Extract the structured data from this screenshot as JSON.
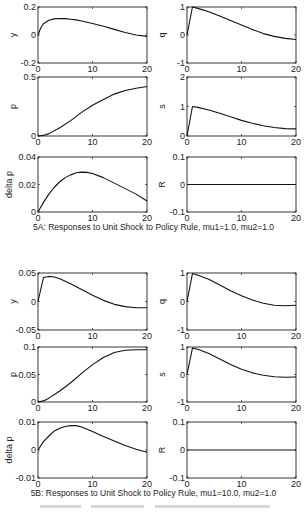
{
  "figure": {
    "captions": [
      {
        "id": "5A",
        "text": "5A: Responses to Unit Shock to Policy Rule, mu1=1.0, mu2=1.0",
        "top": 222
      },
      {
        "id": "5B",
        "text": "5B: Responses to Unit Shock to Policy Rule, mu1=10.0, mu2=1.0",
        "top": 488
      }
    ],
    "footer_text_illegible": true
  },
  "chart_data": [
    {
      "panel": "5A",
      "type": "line",
      "title": "",
      "ylabel": "y",
      "xlabel": "",
      "xlim": [
        0,
        20
      ],
      "ylim": [
        -0.2,
        0.2
      ],
      "xticks": [
        "0",
        "10",
        "20"
      ],
      "yticks": [
        "-0.2",
        "0",
        "0.2"
      ],
      "ytick_values": [
        -0.2,
        0,
        0.2
      ],
      "grid": false,
      "box": {
        "x": 38,
        "y": 7,
        "w": 109,
        "h": 56
      },
      "x": [
        0,
        0.5,
        1,
        2,
        3,
        4,
        5,
        6,
        7,
        8,
        10,
        12,
        14,
        16,
        18,
        20
      ],
      "values": [
        0,
        0.05,
        0.08,
        0.105,
        0.115,
        0.118,
        0.117,
        0.113,
        0.108,
        0.1,
        0.082,
        0.062,
        0.04,
        0.018,
        0.0,
        -0.01
      ]
    },
    {
      "panel": "5A",
      "type": "line",
      "ylabel": "q",
      "xlabel": "",
      "xlim": [
        0,
        20
      ],
      "ylim": [
        -1,
        1
      ],
      "xticks": [
        "0",
        "10",
        "20"
      ],
      "yticks": [
        "-1",
        "0",
        "1"
      ],
      "ytick_values": [
        -1,
        0,
        1
      ],
      "grid": false,
      "box": {
        "x": 187,
        "y": 7,
        "w": 109,
        "h": 56
      },
      "x": [
        0,
        1,
        2,
        4,
        6,
        8,
        10,
        12,
        14,
        16,
        18,
        20
      ],
      "values": [
        0,
        1.0,
        0.95,
        0.83,
        0.68,
        0.52,
        0.36,
        0.2,
        0.05,
        -0.05,
        -0.12,
        -0.16
      ]
    },
    {
      "panel": "5A",
      "type": "line",
      "ylabel": "p",
      "xlabel": "",
      "xlim": [
        0,
        20
      ],
      "ylim": [
        0,
        0.5
      ],
      "xticks": [
        "0",
        "10",
        "20"
      ],
      "yticks": [
        "0",
        "0.5"
      ],
      "ytick_values": [
        0,
        0.5
      ],
      "grid": false,
      "box": {
        "x": 38,
        "y": 77,
        "w": 109,
        "h": 59
      },
      "x": [
        0,
        1,
        2,
        4,
        6,
        8,
        10,
        12,
        14,
        16,
        18,
        20
      ],
      "values": [
        0,
        0.005,
        0.02,
        0.07,
        0.13,
        0.2,
        0.26,
        0.31,
        0.355,
        0.385,
        0.405,
        0.42
      ]
    },
    {
      "panel": "5A",
      "type": "line",
      "ylabel": "s",
      "xlabel": "",
      "xlim": [
        0,
        20
      ],
      "ylim": [
        0,
        2
      ],
      "xticks": [
        "0",
        "10",
        "20"
      ],
      "yticks": [
        "0",
        "1",
        "2"
      ],
      "ytick_values": [
        0,
        1,
        2
      ],
      "grid": false,
      "box": {
        "x": 187,
        "y": 77,
        "w": 109,
        "h": 59
      },
      "x": [
        0,
        1,
        2,
        4,
        6,
        8,
        10,
        12,
        14,
        16,
        18,
        20
      ],
      "values": [
        0,
        1.0,
        0.97,
        0.88,
        0.77,
        0.65,
        0.53,
        0.43,
        0.35,
        0.29,
        0.25,
        0.24
      ]
    },
    {
      "panel": "5A",
      "type": "line",
      "ylabel": "delta p",
      "xlabel": "",
      "xlim": [
        0,
        20
      ],
      "ylim": [
        0,
        0.04
      ],
      "xticks": [
        "0",
        "10",
        "20"
      ],
      "yticks": [
        "0",
        "0.02",
        "0.04"
      ],
      "ytick_values": [
        0,
        0.02,
        0.04
      ],
      "grid": false,
      "box": {
        "x": 38,
        "y": 157,
        "w": 109,
        "h": 55
      },
      "x": [
        0,
        1,
        2,
        3,
        4,
        5,
        6,
        7,
        8,
        9,
        10,
        12,
        14,
        16,
        18,
        20
      ],
      "values": [
        0,
        0.007,
        0.013,
        0.018,
        0.022,
        0.025,
        0.027,
        0.0285,
        0.029,
        0.0288,
        0.028,
        0.025,
        0.021,
        0.017,
        0.013,
        0.008
      ]
    },
    {
      "panel": "5A",
      "type": "line",
      "ylabel": "R",
      "xlabel": "",
      "xlim": [
        0,
        20
      ],
      "ylim": [
        -0.1,
        0.1
      ],
      "xticks": [
        "0",
        "10",
        "20"
      ],
      "yticks": [
        "-0.1",
        "0",
        "0.1"
      ],
      "ytick_values": [
        -0.1,
        0,
        0.1
      ],
      "grid": false,
      "box": {
        "x": 187,
        "y": 157,
        "w": 109,
        "h": 55
      },
      "x": [
        0,
        20
      ],
      "values": [
        0,
        0
      ]
    },
    {
      "panel": "5B",
      "type": "line",
      "ylabel": "y",
      "xlabel": "",
      "xlim": [
        0,
        20
      ],
      "ylim": [
        -0.05,
        0.05
      ],
      "xticks": [
        "0",
        "10",
        "20"
      ],
      "yticks": [
        "-0.05",
        "0",
        "0.05"
      ],
      "ytick_values": [
        -0.05,
        0,
        0.05
      ],
      "grid": false,
      "box": {
        "x": 38,
        "y": 273,
        "w": 109,
        "h": 57
      },
      "x": [
        0,
        1,
        2,
        3,
        4,
        6,
        8,
        10,
        12,
        14,
        16,
        18,
        20
      ],
      "values": [
        0,
        0.042,
        0.044,
        0.043,
        0.04,
        0.031,
        0.021,
        0.011,
        0.002,
        -0.005,
        -0.009,
        -0.011,
        -0.011
      ]
    },
    {
      "panel": "5B",
      "type": "line",
      "ylabel": "q",
      "xlabel": "",
      "xlim": [
        0,
        20
      ],
      "ylim": [
        -1,
        1
      ],
      "xticks": [
        "0",
        "10",
        "20"
      ],
      "yticks": [
        "-1",
        "0",
        "1"
      ],
      "ytick_values": [
        -1,
        0,
        1
      ],
      "grid": false,
      "box": {
        "x": 187,
        "y": 273,
        "w": 109,
        "h": 57
      },
      "x": [
        0,
        1,
        2,
        4,
        6,
        8,
        10,
        12,
        14,
        16,
        18,
        20
      ],
      "values": [
        0,
        0.98,
        0.92,
        0.78,
        0.58,
        0.38,
        0.2,
        0.05,
        -0.06,
        -0.13,
        -0.15,
        -0.13
      ]
    },
    {
      "panel": "5B",
      "type": "line",
      "ylabel": "p",
      "xlabel": "",
      "xlim": [
        0,
        20
      ],
      "ylim": [
        0,
        0.1
      ],
      "xticks": [
        "0",
        "10",
        "20"
      ],
      "yticks": [
        "0",
        "0.05",
        "0.1"
      ],
      "ytick_values": [
        0,
        0.05,
        0.1
      ],
      "grid": false,
      "box": {
        "x": 38,
        "y": 347,
        "w": 109,
        "h": 55
      },
      "x": [
        0,
        1,
        2,
        4,
        6,
        8,
        10,
        12,
        14,
        16,
        18,
        20
      ],
      "values": [
        0,
        0.002,
        0.007,
        0.02,
        0.035,
        0.052,
        0.068,
        0.081,
        0.09,
        0.094,
        0.095,
        0.095
      ]
    },
    {
      "panel": "5B",
      "type": "line",
      "ylabel": "s",
      "xlabel": "",
      "xlim": [
        0,
        20
      ],
      "ylim": [
        -1,
        1
      ],
      "xticks": [
        "0",
        "10",
        "20"
      ],
      "yticks": [
        "-1",
        "0",
        "1"
      ],
      "ytick_values": [
        -1,
        0,
        1
      ],
      "grid": false,
      "box": {
        "x": 187,
        "y": 347,
        "w": 109,
        "h": 55
      },
      "x": [
        0,
        1,
        2,
        4,
        6,
        8,
        10,
        12,
        14,
        16,
        18,
        20
      ],
      "values": [
        0,
        0.96,
        0.92,
        0.76,
        0.56,
        0.36,
        0.19,
        0.06,
        -0.03,
        -0.08,
        -0.1,
        -0.09
      ]
    },
    {
      "panel": "5B",
      "type": "line",
      "ylabel": "delta p",
      "xlabel": "",
      "xlim": [
        0,
        20
      ],
      "ylim": [
        -0.01,
        0.01
      ],
      "xticks": [
        "0",
        "10",
        "20"
      ],
      "yticks": [
        "-0.01",
        "0",
        "0.01"
      ],
      "ytick_values": [
        -0.01,
        0,
        0.01
      ],
      "grid": false,
      "box": {
        "x": 38,
        "y": 422,
        "w": 109,
        "h": 56
      },
      "x": [
        0,
        1,
        2,
        3,
        4,
        5,
        6,
        7,
        8,
        10,
        12,
        14,
        16,
        18,
        20
      ],
      "values": [
        0,
        0.003,
        0.005,
        0.0068,
        0.0078,
        0.0084,
        0.0087,
        0.0087,
        0.0082,
        0.0066,
        0.0048,
        0.0032,
        0.0016,
        0.0003,
        -0.0008
      ]
    },
    {
      "panel": "5B",
      "type": "line",
      "ylabel": "R",
      "xlabel": "",
      "xlim": [
        0,
        20
      ],
      "ylim": [
        -0.1,
        0.1
      ],
      "xticks": [
        "0",
        "10",
        "20"
      ],
      "yticks": [
        "-0.1",
        "0",
        "0.1"
      ],
      "ytick_values": [
        -0.1,
        0,
        0.1
      ],
      "grid": false,
      "box": {
        "x": 187,
        "y": 422,
        "w": 109,
        "h": 56
      },
      "x": [
        0,
        20
      ],
      "values": [
        0,
        0
      ]
    }
  ]
}
